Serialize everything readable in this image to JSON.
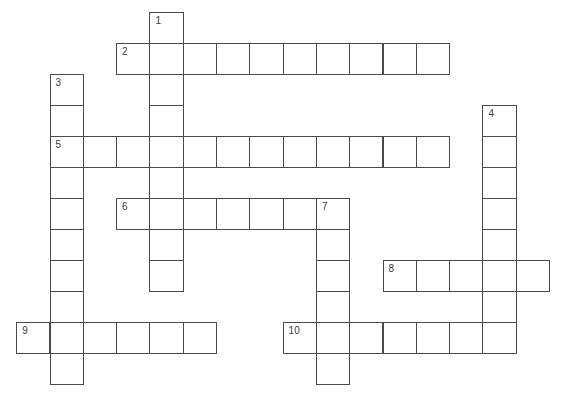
{
  "puzzle": {
    "type": "crossword",
    "grid": {
      "cell_width": 33.3,
      "cell_height": 31,
      "origin_x": 16.7,
      "origin_y": 12,
      "line_color": "#4a4a4a",
      "number_color": "#3a3a3a",
      "background": "#ffffff"
    },
    "words": [
      {
        "number": "1",
        "direction": "down",
        "col": 4,
        "row": 0,
        "length": 9
      },
      {
        "number": "2",
        "direction": "across",
        "col": 3,
        "row": 1,
        "length": 10
      },
      {
        "number": "3",
        "direction": "down",
        "col": 1,
        "row": 2,
        "length": 10
      },
      {
        "number": "4",
        "direction": "down",
        "col": 14,
        "row": 3,
        "length": 8
      },
      {
        "number": "5",
        "direction": "across",
        "col": 1,
        "row": 4,
        "length": 12
      },
      {
        "number": "6",
        "direction": "across",
        "col": 3,
        "row": 6,
        "length": 7
      },
      {
        "number": "7",
        "direction": "down",
        "col": 9,
        "row": 6,
        "length": 6
      },
      {
        "number": "8",
        "direction": "across",
        "col": 11,
        "row": 8,
        "length": 5
      },
      {
        "number": "9",
        "direction": "across",
        "col": 0,
        "row": 10,
        "length": 6
      },
      {
        "number": "10",
        "direction": "across",
        "col": 8,
        "row": 10,
        "length": 7
      }
    ]
  }
}
